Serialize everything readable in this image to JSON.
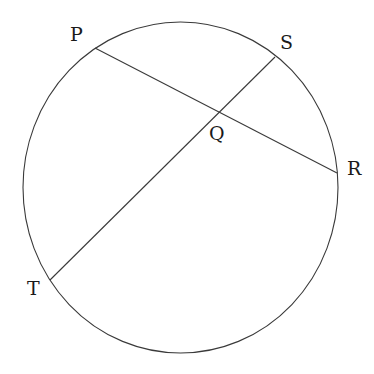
{
  "diagram": {
    "type": "circle-with-intersecting-chords",
    "stroke_color": "#3a3a3a",
    "label_color": "#1a1a1a",
    "background": "#ffffff",
    "circle": {
      "cx": 180.5,
      "cy": 187.5,
      "rx": 157.5,
      "ry": 165.5
    },
    "points": {
      "P": {
        "label": "P",
        "x": 95,
        "y": 48,
        "label_x": 70,
        "label_y": 41
      },
      "S": {
        "label": "S",
        "x": 275,
        "y": 57,
        "label_x": 280,
        "label_y": 49
      },
      "Q": {
        "label": "Q",
        "x": 219,
        "y": 113,
        "label_x": 209,
        "label_y": 140
      },
      "R": {
        "label": "R",
        "x": 337,
        "y": 173,
        "label_x": 347,
        "label_y": 175
      },
      "T": {
        "label": "T",
        "x": 50,
        "y": 280,
        "label_x": 27,
        "label_y": 295
      }
    },
    "chords": [
      {
        "name": "PR",
        "from": "P",
        "to": "R"
      },
      {
        "name": "ST",
        "from": "S",
        "to": "T"
      }
    ],
    "intersection": "Q"
  }
}
